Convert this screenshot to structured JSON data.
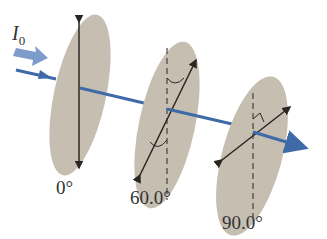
{
  "diagram": {
    "type": "polarizer-sequence",
    "incident_beam_label": "I",
    "incident_beam_subscript": "0",
    "polarizers": [
      {
        "label": "0°",
        "axis_angle_deg": 0
      },
      {
        "label": "60.0°",
        "axis_angle_deg": 60
      },
      {
        "label": "90.0°",
        "axis_angle_deg": 90
      }
    ],
    "colors": {
      "disk": "#c6beb1",
      "beam": "#3f6aa8",
      "incident_arrow": "#7d9ccc",
      "axis_line": "#2a2622",
      "text": "#333333"
    }
  }
}
